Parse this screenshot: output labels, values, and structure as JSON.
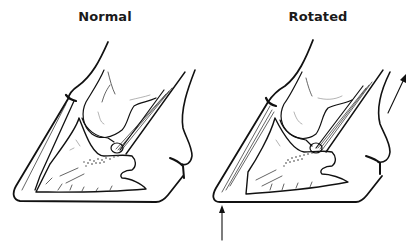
{
  "figure": {
    "panels": [
      {
        "id": "normal",
        "title": "Normal",
        "depicts": "hoof cross-section with coffin bone parallel to hoof wall",
        "arrows": []
      },
      {
        "id": "rotated",
        "title": "Rotated",
        "depicts": "hoof cross-section with coffin bone rotated away from hoof wall (laminitis)",
        "arrows": [
          {
            "name": "up-arrow-toe",
            "direction": "up"
          },
          {
            "name": "up-right-arrow-heel",
            "direction": "up-right"
          }
        ]
      }
    ],
    "colors": {
      "ink": "#111111",
      "background": "#ffffff"
    }
  }
}
